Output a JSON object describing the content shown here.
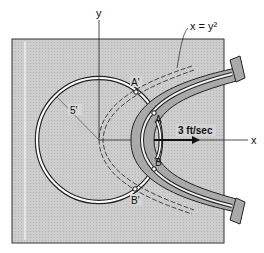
{
  "figure": {
    "curve_label": "x = y²",
    "axis_x_label": "x",
    "axis_y_label": "y",
    "radius_label": "5'",
    "velocity_label": "3 ft/sec",
    "points": {
      "A": "A",
      "B": "B",
      "A_prime": "A'",
      "B_prime": "B'"
    }
  },
  "colors": {
    "plate": "#c9c9c9",
    "slot_arm": "#a9a9a9",
    "ring": "#ffffff",
    "line": "#222222",
    "background": "#ffffff"
  }
}
